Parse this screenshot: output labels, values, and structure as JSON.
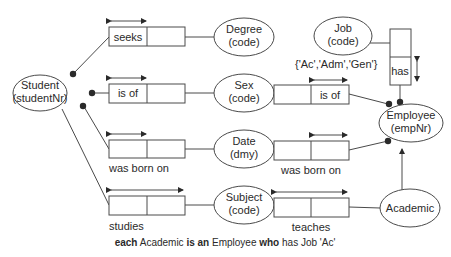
{
  "diagram": {
    "type": "ORM conceptual schema",
    "entities": [
      {
        "id": "student",
        "name": "Student",
        "ref": "(studentNr)"
      },
      {
        "id": "degree",
        "name": "Degree",
        "ref": "(code)"
      },
      {
        "id": "sex",
        "name": "Sex",
        "ref": "(code)"
      },
      {
        "id": "date",
        "name": "Date",
        "ref": "(dmy)"
      },
      {
        "id": "subject",
        "name": "Subject",
        "ref": "(code)"
      },
      {
        "id": "job",
        "name": "Job",
        "ref": "(code)"
      },
      {
        "id": "employee",
        "name": "Employee",
        "ref": "(empNr)"
      },
      {
        "id": "academic",
        "name": "Academic",
        "ref": ""
      }
    ],
    "fact_types": [
      {
        "id": "seeks",
        "reading": "seeks",
        "from": "Student",
        "to": "Degree"
      },
      {
        "id": "student_is_of",
        "reading": "is of",
        "from": "Student",
        "to": "Sex"
      },
      {
        "id": "student_born",
        "reading": "was born on",
        "from": "Student",
        "to": "Date"
      },
      {
        "id": "studies",
        "reading": "studies",
        "from": "Student",
        "to": "Subject"
      },
      {
        "id": "employee_is_of",
        "reading": "is of",
        "from": "Employee",
        "to": "Sex"
      },
      {
        "id": "employee_born",
        "reading": "was born on",
        "from": "Employee",
        "to": "Date"
      },
      {
        "id": "teaches",
        "reading": "teaches",
        "from": "Academic",
        "to": "Subject"
      },
      {
        "id": "has",
        "reading": "has",
        "from": "Employee",
        "to": "Job"
      }
    ],
    "value_constraint": "{'Ac','Adm','Gen'}",
    "subtype": {
      "sub": "Academic",
      "super": "Employee"
    },
    "caption": {
      "parts": [
        {
          "text": "each",
          "bold": true
        },
        {
          "text": " Academic ",
          "bold": false
        },
        {
          "text": "is an",
          "bold": true
        },
        {
          "text": " Employee ",
          "bold": false
        },
        {
          "text": "who",
          "bold": true
        },
        {
          "text": " has Job 'Ac'",
          "bold": false
        }
      ]
    }
  }
}
